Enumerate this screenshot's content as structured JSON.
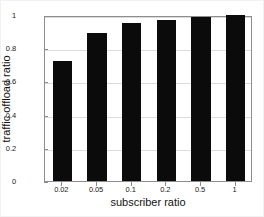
{
  "chart_data": {
    "type": "bar",
    "title": "",
    "xlabel": "subscriber ratio",
    "ylabel": "traffic offload ratio",
    "categories": [
      "0.02",
      "0.05",
      "0.1",
      "0.2",
      "0.5",
      "1"
    ],
    "values": [
      0.72,
      0.89,
      0.95,
      0.97,
      0.99,
      1.0
    ],
    "series": [
      {
        "name": "traffic offload ratio",
        "values": [
          0.72,
          0.89,
          0.95,
          0.97,
          0.99,
          1.0
        ]
      }
    ],
    "ylim": [
      0,
      1
    ],
    "yticks": [
      "0",
      "0.2",
      "0.4",
      "0.6",
      "0.8",
      "1"
    ],
    "ytick_values": [
      0,
      0.2,
      0.4,
      0.6,
      0.8,
      1
    ],
    "xticks": [
      "0.02",
      "0.05",
      "0.1",
      "0.2",
      "0.5",
      "1"
    ],
    "grid": true,
    "grid_axis": "y",
    "legend": null,
    "legend_position": "none",
    "annotations": [],
    "bar_color": "#0b0b0b",
    "background_color": "#ffffff",
    "axis_color": "#8d8d8d",
    "gridline_color": "#dcdcdc"
  }
}
